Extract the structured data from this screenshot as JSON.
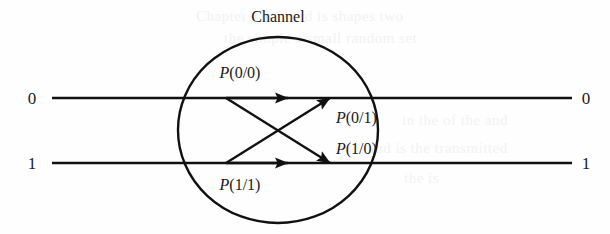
{
  "figure": {
    "type": "diagram",
    "title": "Channel",
    "inputs": [
      {
        "label": "0",
        "x": 38,
        "y": 104
      },
      {
        "label": "1",
        "x": 38,
        "y": 169
      }
    ],
    "outputs": [
      {
        "label": "0",
        "x": 586,
        "y": 104
      },
      {
        "label": "1",
        "x": 586,
        "y": 169
      }
    ],
    "transitions": [
      {
        "name": "p-0-given-0",
        "label_p": "P",
        "label_rest": "(0/0)",
        "from": "0",
        "to": "0",
        "x": 240,
        "y": 78
      },
      {
        "name": "p-0-given-1",
        "label_p": "P",
        "label_rest": "(0/1)",
        "from": "1",
        "to": "0",
        "x": 336,
        "y": 123
      },
      {
        "name": "p-1-given-0",
        "label_p": "P",
        "label_rest": "(1/0)",
        "from": "0",
        "to": "1",
        "x": 336,
        "y": 154
      },
      {
        "name": "p-1-given-1",
        "label_p": "P",
        "label_rest": "(1/1)",
        "from": "1",
        "to": "1",
        "x": 240,
        "y": 190
      }
    ],
    "channel_ellipse": {
      "cx": 278,
      "cy": 130,
      "rx": 100,
      "ry": 93
    },
    "colors": {
      "ink": "#111111",
      "background": "#fefefe"
    }
  },
  "bleed_text": [
    {
      "t": "Chapter  The word is  shapes   two",
      "x": 196,
      "y": 16
    },
    {
      "t": "the simple  a  small   random  set",
      "x": 224,
      "y": 38
    },
    {
      "t": "in  the   of  the    and",
      "x": 402,
      "y": 120
    },
    {
      "t": "and   is the    transmitted",
      "x": 368,
      "y": 148
    },
    {
      "t": "the    is",
      "x": 404,
      "y": 178
    }
  ]
}
